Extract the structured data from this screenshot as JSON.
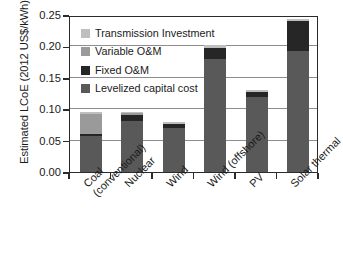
{
  "chart_data": {
    "type": "bar",
    "stacked": true,
    "title": "",
    "xlabel": "",
    "ylabel": "Estimated LCoE (2012 US$/kWh)",
    "ylim": [
      0.0,
      0.25
    ],
    "yticks": [
      "0.00",
      "0.05",
      "0.10",
      "0.15",
      "0.20",
      "0.25"
    ],
    "ytick_values": [
      0.0,
      0.05,
      0.1,
      0.15,
      0.2,
      0.25
    ],
    "grid": "horizontal",
    "legend_position": "upper-left-inside",
    "categories": [
      "Coal (conventional)",
      "Nuclear",
      "Wind",
      "Wind (offshore)",
      "PV",
      "Solar thermal"
    ],
    "category_lines": [
      [
        "Coal",
        "(conventional)"
      ],
      [
        "Nuclear",
        ""
      ],
      [
        "Wind",
        ""
      ],
      [
        "Wind (offshore)",
        ""
      ],
      [
        "PV",
        ""
      ],
      [
        "Solar thermal",
        ""
      ]
    ],
    "series": [
      {
        "name": "Levelized capital cost",
        "color": "#595959",
        "values": [
          0.057,
          0.082,
          0.07,
          0.18,
          0.12,
          0.193
        ]
      },
      {
        "name": "Fixed O&M",
        "color": "#262626",
        "values": [
          0.004,
          0.009,
          0.006,
          0.018,
          0.007,
          0.047
        ]
      },
      {
        "name": "Variable O&M",
        "color": "#9a9a9a",
        "values": [
          0.031,
          0.003,
          0.001,
          0.0,
          0.0,
          0.0
        ]
      },
      {
        "name": "Transmission Investment",
        "color": "#bfbfbf",
        "values": [
          0.003,
          0.002,
          0.003,
          0.004,
          0.003,
          0.004
        ]
      }
    ],
    "totals": [
      0.095,
      0.096,
      0.08,
      0.202,
      0.13,
      0.244
    ]
  },
  "legend": {
    "items": [
      {
        "label": "Transmission Investment",
        "color": "#bfbfbf"
      },
      {
        "label": "Variable O&M",
        "color": "#9a9a9a"
      },
      {
        "label": "Fixed O&M",
        "color": "#262626"
      },
      {
        "label": "Levelized capital cost",
        "color": "#595959"
      }
    ]
  },
  "axis": {
    "y_title": "Estimated LCoE (2012 US$/kWh)"
  }
}
